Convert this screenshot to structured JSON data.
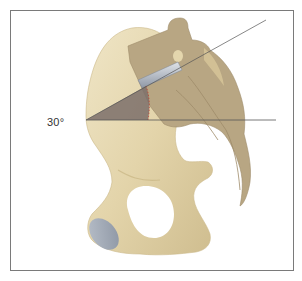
{
  "figure": {
    "type": "anatomical-illustration",
    "annotations": {
      "angle_label": "30°",
      "angle_degrees": 30
    },
    "colors": {
      "bone": "#e6d9b4",
      "bone_shadow": "#cdbb8e",
      "sacrum": "#b8a683",
      "sacrum_dark": "#9e8c69",
      "angle_wedge": "#7b6f6a",
      "cartilage": "#9aa3b0",
      "line": "#555555",
      "frame": "#7a7a7a"
    }
  }
}
